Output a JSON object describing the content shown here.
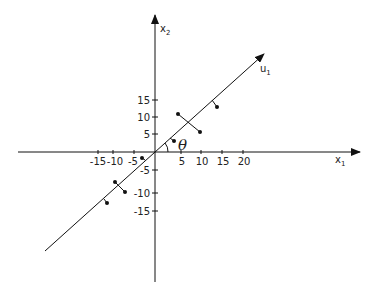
{
  "diagram": {
    "axes": {
      "x_label": "x",
      "x_sub": "1",
      "y_label": "x",
      "y_sub": "2",
      "principal_label": "u",
      "principal_sub": "1",
      "angle_label": "θ"
    },
    "x_ticks": [
      "-15",
      "-10",
      "-5",
      "5",
      "10",
      "15",
      "20"
    ],
    "y_ticks": [
      "15",
      "10",
      "5",
      "-5",
      "-10",
      "-15"
    ]
  }
}
